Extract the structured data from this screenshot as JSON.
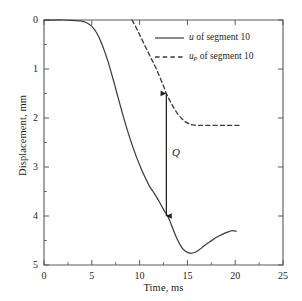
{
  "chart_data": {
    "type": "line",
    "title": "",
    "xlabel": "Time, ms",
    "ylabel": "Displacement, mm",
    "xlim": [
      0,
      25
    ],
    "ylim": [
      5,
      0
    ],
    "y_axis_inverted": true,
    "grid": false,
    "xticks": [
      0,
      5,
      10,
      15,
      20,
      25
    ],
    "xtick_labels": [
      "0",
      "5",
      "10",
      "15",
      "20",
      "25"
    ],
    "x_minor_tick_interval": 2.5,
    "yticks": [
      0,
      1,
      2,
      3,
      4,
      5
    ],
    "ytick_labels": [
      "0",
      "1",
      "2",
      "3",
      "4",
      "5"
    ],
    "y_minor_tick_interval": 0.5,
    "legend_position": "upper right",
    "series": [
      {
        "name": "u of segment 10",
        "name_symbol": "u",
        "name_subscript": "",
        "name_suffix": " of segment 10",
        "style": "solid",
        "color": "#3d3d3d",
        "x": [
          0.0,
          1.0,
          2.0,
          3.0,
          3.8,
          4.4,
          5.0,
          5.5,
          5.9,
          6.3,
          6.7,
          7.0,
          7.4,
          7.8,
          8.2,
          8.6,
          9.0,
          9.4,
          9.8,
          10.2,
          10.6,
          11.0,
          11.4,
          11.8,
          12.2,
          12.6,
          12.9,
          13.2,
          13.6,
          14.0,
          14.4,
          14.8,
          15.3,
          15.8,
          16.3,
          16.8,
          17.4,
          18.0,
          18.6,
          19.2,
          19.7,
          20.1
        ],
        "y": [
          0.0,
          0.0,
          0.0,
          0.01,
          0.02,
          0.05,
          0.13,
          0.26,
          0.42,
          0.62,
          0.85,
          1.05,
          1.33,
          1.62,
          1.9,
          2.17,
          2.42,
          2.65,
          2.86,
          3.05,
          3.22,
          3.38,
          3.5,
          3.62,
          3.76,
          3.9,
          3.99,
          4.12,
          4.32,
          4.5,
          4.64,
          4.72,
          4.76,
          4.74,
          4.68,
          4.6,
          4.52,
          4.44,
          4.38,
          4.33,
          4.3,
          4.31
        ]
      },
      {
        "name": "up of segment 10",
        "name_symbol": "u",
        "name_subscript": "p",
        "name_suffix": " of segment 10",
        "style": "dashed",
        "color": "#3d3d3d",
        "x": [
          9.2,
          9.6,
          10.0,
          10.6,
          11.2,
          11.8,
          12.4,
          12.8,
          13.2,
          13.6,
          14.0,
          14.4,
          14.8,
          15.2,
          15.6,
          16.2,
          17.0,
          18.0,
          19.0,
          20.0,
          20.5
        ],
        "y": [
          0.0,
          0.14,
          0.3,
          0.54,
          0.78,
          1.02,
          1.3,
          1.5,
          1.66,
          1.8,
          1.92,
          2.01,
          2.08,
          2.12,
          2.14,
          2.15,
          2.15,
          2.15,
          2.15,
          2.15,
          2.15
        ]
      }
    ],
    "annotations": [
      {
        "name": "Q",
        "label": "Q",
        "type": "double-headed-arrow",
        "x": 12.8,
        "y_top": 1.5,
        "y_bottom": 4.0,
        "label_x": 13.4,
        "label_y": 2.72
      }
    ]
  },
  "legend": {
    "entries": [
      {
        "symbol": "u",
        "subscript": "",
        "suffix": " of segment 10",
        "style": "solid"
      },
      {
        "symbol": "u",
        "subscript": "p",
        "suffix": " of segment 10",
        "style": "dashed"
      }
    ]
  }
}
